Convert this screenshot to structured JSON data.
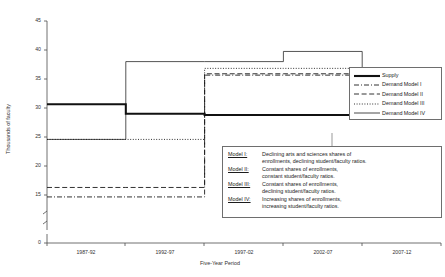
{
  "chart_data": {
    "type": "line",
    "title": "",
    "xlabel": "Five-Year Period",
    "ylabel": "Thousands of faculty",
    "categories": [
      "1987-92",
      "1992-97",
      "1997-02",
      "2002-07",
      "2007-12"
    ],
    "ylim": [
      15,
      45
    ],
    "yticks": [
      "0",
      "15",
      "20",
      "25",
      "30",
      "35",
      "40",
      "45"
    ],
    "axis_break": true,
    "grid": false,
    "legend_position": "right",
    "step_style": "horizontal-segments",
    "series": [
      {
        "name": "Supply",
        "style": "solid-thick",
        "values": [
          32.7,
          31.3,
          31.1,
          31.1,
          31.1
        ]
      },
      {
        "name": "Demand Model I",
        "style": "dash-dot",
        "values": [
          19.0,
          19.0,
          37.0,
          37.0,
          33.5
        ]
      },
      {
        "name": "Demand Model II",
        "style": "dashed",
        "values": [
          20.4,
          20.4,
          37.2,
          37.2,
          34.0
        ]
      },
      {
        "name": "Demand Model III",
        "style": "dotted",
        "values": [
          27.5,
          27.5,
          38.0,
          38.0,
          34.5
        ]
      },
      {
        "name": "Demand Model IV",
        "style": "solid-thin",
        "values": [
          27.5,
          39.0,
          39.0,
          40.5,
          34.2
        ]
      }
    ]
  },
  "legend": {
    "items": [
      {
        "label": "Supply"
      },
      {
        "label": "Demand Model I"
      },
      {
        "label": "Demand Model II"
      },
      {
        "label": "Demand Model III"
      },
      {
        "label": "Demand Model IV"
      }
    ]
  },
  "notes": {
    "rows": [
      {
        "key": "Model I:",
        "line1": "Declining arts and sciences shares of",
        "line2": "enrollments, declining student/faculty ratios."
      },
      {
        "key": "Model II:",
        "line1": "Constant shares of enrollments,",
        "line2": "constant student/faculty ratios."
      },
      {
        "key": "Model III:",
        "line1": "Constant shares of enrollments,",
        "line2": "declining student/faculty ratios."
      },
      {
        "key": "Model IV:",
        "line1": "Increasing shares of enrollments,",
        "line2": "increasing student/faculty ratios."
      }
    ]
  },
  "colors": {
    "ink": "#1c1c1c",
    "axis": "#4d4d4d",
    "frame": "#6e6e6e",
    "background": "#ffffff"
  }
}
